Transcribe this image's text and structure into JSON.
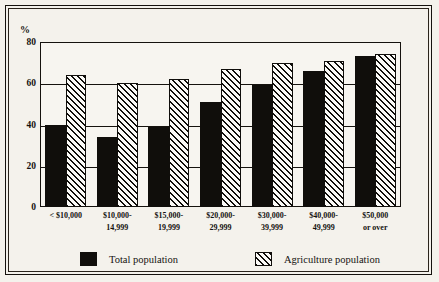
{
  "chart_data": {
    "type": "bar",
    "title": "",
    "subtitle": "",
    "xlabel": "",
    "ylabel": "%",
    "ylim": [
      0,
      80
    ],
    "yticks": [
      0,
      20,
      40,
      60,
      80
    ],
    "ytick_labels": [
      "0",
      "20",
      "40",
      "60",
      "80"
    ],
    "grid": true,
    "legend_position": "bottom",
    "categories": [
      "< $10,000",
      "$10,000-14,999",
      "$15,000-19,999",
      "$20,000-29,999",
      "$30,000-39,999",
      "$40,000-49,999",
      "$50,000 or over"
    ],
    "category_lines": [
      [
        "< $10,000",
        ""
      ],
      [
        "$10,000-",
        "14,999"
      ],
      [
        "$15,000-",
        "19,999"
      ],
      [
        "$20,000-",
        "29,999"
      ],
      [
        "$30,000-",
        "39,999"
      ],
      [
        "$40,000-",
        "49,999"
      ],
      [
        "$50,000",
        "or over"
      ]
    ],
    "series": [
      {
        "name": "Total population",
        "fill": "solid",
        "color": "#100e0b",
        "values": [
          40,
          34,
          39,
          51,
          59,
          66,
          73
        ]
      },
      {
        "name": "Agriculture population",
        "fill": "diagonal-hatch",
        "color": "#100e0b",
        "values": [
          64,
          60,
          62,
          67,
          70,
          71,
          74
        ]
      }
    ]
  },
  "axis": {
    "unit_label": "%"
  },
  "legend": {
    "items": [
      {
        "label": "Total population",
        "swatch": "solid-black-swatch"
      },
      {
        "label": "Agriculture population",
        "swatch": "hatched-swatch"
      }
    ]
  }
}
